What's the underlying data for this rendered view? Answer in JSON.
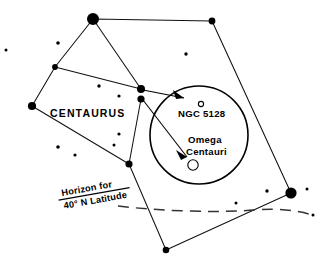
{
  "figure": {
    "kind": "star-chart",
    "width": 322,
    "height": 267,
    "background_color": "#ffffff",
    "ink_color": "#000000",
    "horizon_color": "#333333"
  },
  "labels": {
    "constellation": "CENTAURUS",
    "deep_sky_1": "NGC 5128",
    "deep_sky_2_line1": "Omega",
    "deep_sky_2_line2": "Centauri",
    "horizon_line1": "Horizon for",
    "horizon_line2": "40° N Latitude"
  },
  "label_positions": {
    "constellation": {
      "x": 50,
      "y": 117
    },
    "deep_sky_1": {
      "x": 178,
      "y": 117
    },
    "deep_sky_2_line1": {
      "x": 188,
      "y": 143
    },
    "deep_sky_2_line2": {
      "x": 186,
      "y": 155
    },
    "horizon_block": {
      "x": 62,
      "y": 196,
      "rotate": -10
    }
  },
  "finder_circle": {
    "cx": 199,
    "cy": 135,
    "r": 49
  },
  "deep_sky_markers": [
    {
      "name": "ngc-5128-marker",
      "cx": 201,
      "cy": 104,
      "r": 2.6,
      "style": "open"
    },
    {
      "name": "omega-centauri-marker",
      "cx": 193,
      "cy": 165,
      "r": 5.2,
      "style": "open"
    }
  ],
  "constellation_polygon": [
    {
      "x": 93,
      "y": 19
    },
    {
      "x": 212,
      "y": 21
    },
    {
      "x": 291,
      "y": 193
    },
    {
      "x": 166,
      "y": 250
    },
    {
      "x": 129,
      "y": 164
    },
    {
      "x": 32,
      "y": 106
    },
    {
      "x": 55,
      "y": 67
    }
  ],
  "constellation_extra_segments": [
    {
      "name": "segment-top-to-hub",
      "x1": 93,
      "y1": 19,
      "x2": 141,
      "y2": 89
    },
    {
      "name": "segment-branch-to-hub",
      "x1": 55,
      "y1": 67,
      "x2": 141,
      "y2": 89
    },
    {
      "name": "segment-hub-to-lower",
      "x1": 141,
      "y1": 99,
      "x2": 129,
      "y2": 164
    }
  ],
  "bright_stars": [
    {
      "name": "star-top-vertex",
      "cx": 93,
      "cy": 19,
      "r": 6.0
    },
    {
      "name": "star-top-right-vertex",
      "cx": 212,
      "cy": 21,
      "r": 3.4
    },
    {
      "name": "star-east-bright",
      "cx": 291,
      "cy": 193,
      "r": 5.6
    },
    {
      "name": "star-south-vertex",
      "cx": 166,
      "cy": 250,
      "r": 3.3
    },
    {
      "name": "star-lower-mid-vertex",
      "cx": 129,
      "cy": 164,
      "r": 3.6
    },
    {
      "name": "star-west-vertex",
      "cx": 32,
      "cy": 106,
      "r": 4.1
    },
    {
      "name": "star-branch-vertex",
      "cx": 55,
      "cy": 67,
      "r": 2.9
    },
    {
      "name": "star-hub-upper",
      "cx": 141,
      "cy": 89,
      "r": 4.0
    },
    {
      "name": "star-hub-lower",
      "cx": 141,
      "cy": 99,
      "r": 3.6
    }
  ],
  "field_stars": [
    {
      "name": "field-star-1",
      "cx": 6,
      "cy": 50,
      "r": 1.5
    },
    {
      "name": "field-star-2",
      "cx": 58,
      "cy": 43,
      "r": 1.8
    },
    {
      "name": "field-star-3",
      "cx": 99,
      "cy": 86,
      "r": 1.7
    },
    {
      "name": "field-star-4",
      "cx": 119,
      "cy": 96,
      "r": 1.6
    },
    {
      "name": "field-star-5",
      "cx": 119,
      "cy": 134,
      "r": 1.6
    },
    {
      "name": "field-star-6",
      "cx": 114,
      "cy": 145,
      "r": 1.5
    },
    {
      "name": "field-star-7",
      "cx": 58,
      "cy": 147,
      "r": 1.8
    },
    {
      "name": "field-star-8",
      "cx": 75,
      "cy": 155,
      "r": 1.6
    },
    {
      "name": "field-star-9",
      "cx": 186,
      "cy": 54,
      "r": 1.7
    },
    {
      "name": "field-star-10",
      "cx": 267,
      "cy": 191,
      "r": 1.7
    },
    {
      "name": "field-star-11",
      "cx": 236,
      "cy": 203,
      "r": 1.5
    },
    {
      "name": "field-star-12",
      "cx": 307,
      "cy": 189,
      "r": 1.5
    },
    {
      "name": "field-star-13",
      "cx": 313,
      "cy": 215,
      "r": 1.5
    }
  ],
  "pointer_arrows": [
    {
      "name": "arrow-to-ngc-5128",
      "x1": 143,
      "y1": 90,
      "x2": 184,
      "y2": 98,
      "head": "M 184 98 L 173 90 L 176 99 Z"
    },
    {
      "name": "arrow-to-omega-centauri",
      "x1": 143,
      "y1": 100,
      "x2": 187,
      "y2": 157,
      "head": "M 187 157 L 176 150 L 181 160 Z"
    }
  ],
  "horizon": {
    "name": "horizon-curve",
    "path": "M 118 206 C 160 211 215 213 255 210 C 280 208 300 211 312 215"
  }
}
